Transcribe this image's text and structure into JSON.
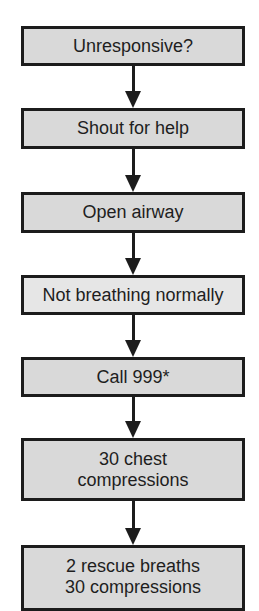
{
  "diagram": {
    "type": "flowchart",
    "direction": "top-to-bottom",
    "colors": {
      "box_fill": "#d9d9d9",
      "box_fill_light": "#e6e6e6",
      "border": "#1c1c1c",
      "text": "#1e1e1e",
      "background": "#ffffff"
    },
    "steps": [
      {
        "label": "Unresponsive?"
      },
      {
        "label": "Shout for help"
      },
      {
        "label": "Open airway"
      },
      {
        "label": "Not breathing normally"
      },
      {
        "label": "Call 999*"
      },
      {
        "label": "30 chest\ncompressions"
      },
      {
        "label": "2 rescue breaths\n30 compressions"
      }
    ]
  }
}
